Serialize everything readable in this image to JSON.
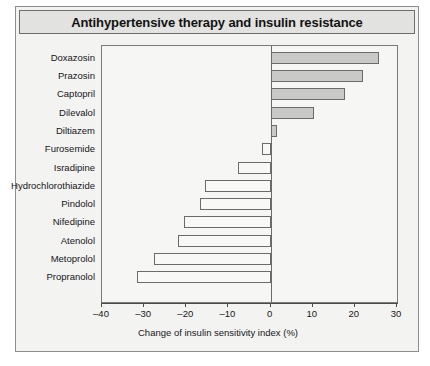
{
  "figure": {
    "title": "Antihypertensive therapy and insulin resistance"
  },
  "chart_data": {
    "type": "bar",
    "orientation": "horizontal",
    "title": "Antihypertensive therapy and insulin resistance",
    "xlabel": "Change of insulin sensitivity index (%)",
    "ylabel": "",
    "xlim": [
      -40,
      30
    ],
    "xticks": [
      -40,
      -30,
      -20,
      -10,
      0,
      10,
      20,
      30
    ],
    "xtick_labels": [
      "–40",
      "–30",
      "–20",
      "–10",
      "0",
      "10",
      "20",
      "30"
    ],
    "grid": false,
    "legend": null,
    "categories": [
      "Doxazosin",
      "Prazosin",
      "Captopril",
      "Dilevalol",
      "Diltiazem",
      "Furosemide",
      "Isradipine",
      "Hydrochlorothiazide",
      "Pindolol",
      "Nifedipine",
      "Atenolol",
      "Metoprolol",
      "Propranolol"
    ],
    "values": [
      25.7,
      22.0,
      17.6,
      10.4,
      1.5,
      -2.0,
      -7.7,
      -15.5,
      -16.7,
      -20.5,
      -22.0,
      -27.7,
      -31.8
    ],
    "colors": {
      "positive_fill": "#c9c9c7",
      "negative_fill": "#f8f8f6",
      "bar_border": "#6b6b6b",
      "axis": "#4c4c4c",
      "plot_background": "#f6f6f4",
      "figure_background": "#f3f3f1",
      "title_background": "#e2e2e0",
      "text": "#16161a"
    }
  }
}
